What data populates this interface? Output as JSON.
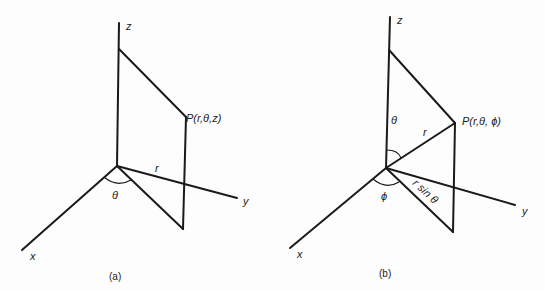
{
  "figures": [
    {
      "id": "a",
      "caption": "(a)",
      "title": "Cylindrical coordinates",
      "labels": {
        "z_axis": "z",
        "y_axis": "y",
        "x_axis": "x",
        "point": "P(r,θ,z)",
        "radius": "r",
        "angle": "θ"
      }
    },
    {
      "id": "b",
      "caption": "(b)",
      "title": "Spherical coordinates",
      "labels": {
        "z_axis": "z",
        "y_axis": "y",
        "x_axis": "x",
        "point": "P(r,θ, ϕ)",
        "radius": "r",
        "polar_angle": "θ",
        "azimuth_angle": "ϕ",
        "projection": "r sin θ"
      }
    }
  ]
}
